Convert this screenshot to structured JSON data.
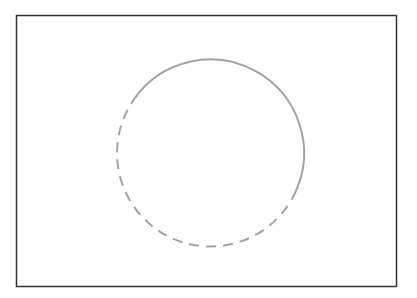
{
  "diagram": {
    "frame": {
      "x": 16.5,
      "y": 15.5,
      "width": 380,
      "height": 271,
      "stroke": "#333333",
      "stroke_width": 1.5
    },
    "circle": {
      "cx": 210.5,
      "cy": 153,
      "r": 93.5,
      "stroke": "#a3a3a3",
      "stroke_width": 2,
      "solid_arc": {
        "start_deg": 215,
        "end_deg": 24,
        "direction": "clockwise"
      },
      "dashed_arc": {
        "start_deg": 24,
        "end_deg": 215,
        "direction": "clockwise",
        "dash": "10 7"
      }
    }
  }
}
